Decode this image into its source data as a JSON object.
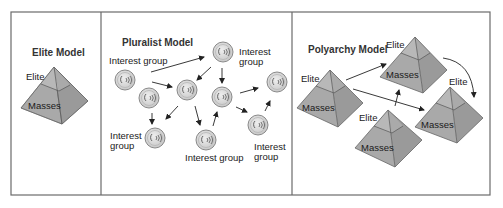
{
  "panels": {
    "elite": {
      "title": "Elite Model",
      "pyramid": {
        "top_label": "Elite",
        "bottom_label": "Masses"
      }
    },
    "pluralist": {
      "title": "Pluralist Model",
      "group_labels": [
        {
          "line1": "Interest group",
          "line2": ""
        },
        {
          "line1": "Interest",
          "line2": "group"
        },
        {
          "line1": "Interest",
          "line2": "group"
        },
        {
          "line1": "Interest group",
          "line2": ""
        },
        {
          "line1": "Interest",
          "line2": "group"
        }
      ],
      "node_icon": "interest-group-circle-icon",
      "node_count": 9
    },
    "polyarchy": {
      "title": "Polyarchy Model",
      "pyramids": [
        {
          "top_label": "Elite",
          "bottom_label": "Masses"
        },
        {
          "top_label": "Elite",
          "bottom_label": "Masses"
        },
        {
          "top_label": "Elite",
          "bottom_label": "Masses"
        },
        {
          "top_label": "Elite",
          "bottom_label": "Masses"
        }
      ]
    }
  },
  "colors": {
    "border": "#6b6b6b",
    "pyramid_fill": "#a9a9a9",
    "pyramid_light": "#bdbdbd",
    "pyramid_dark": "#959595",
    "pyramid_edge": "#666666",
    "circle_fill": "#d9d9d9",
    "circle_stroke": "#8a8a8a",
    "arrow": "#222222"
  }
}
